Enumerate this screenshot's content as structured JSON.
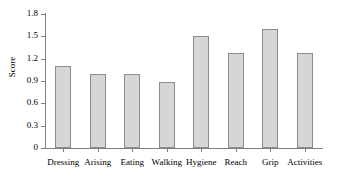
{
  "chart_data": {
    "type": "bar",
    "title": "",
    "xlabel": "",
    "ylabel": "Score",
    "categories": [
      "Dressing",
      "Arising",
      "Eating",
      "Walking",
      "Hygiene",
      "Reach",
      "Grip",
      "Activities"
    ],
    "values": [
      1.1,
      1.0,
      1.0,
      0.89,
      1.5,
      1.28,
      1.6,
      1.28
    ],
    "ylim": [
      0,
      1.8
    ],
    "yticks": [
      0,
      0.3,
      0.6,
      0.9,
      1.2,
      1.5,
      1.8
    ],
    "ytick_labels": [
      "0",
      "0.3",
      "0.6",
      "0.9",
      "1.2",
      "1.5",
      "1.8"
    ],
    "grid": false,
    "legend": null,
    "bar_fill_color": "#d6d6d6",
    "bar_edge_color": "#8c8c8c",
    "axis_color": "#808080",
    "text_color": "#000000"
  }
}
